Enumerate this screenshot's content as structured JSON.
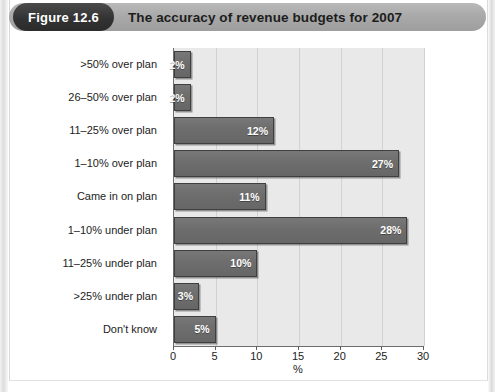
{
  "figure": {
    "badge_label": "Figure 12.6",
    "title": "The accuracy of revenue budgets for 2007"
  },
  "chart_data": {
    "type": "bar",
    "orientation": "horizontal",
    "title": "The accuracy of revenue budgets for 2007",
    "xlabel": "%",
    "ylabel": "",
    "xlim": [
      0,
      30
    ],
    "xticks": [
      0,
      5,
      10,
      15,
      20,
      25,
      30
    ],
    "xtick_labels": [
      "0",
      "5",
      "10",
      "15",
      "20",
      "25",
      "30"
    ],
    "grid": true,
    "legend": false,
    "categories": [
      ">50% over plan",
      "26–50% over plan",
      "11–25% over plan",
      "1–10% over plan",
      "Came in on plan",
      "1–10% under plan",
      "11–25% under plan",
      ">25% under plan",
      "Don't know"
    ],
    "values": [
      2,
      2,
      12,
      27,
      11,
      28,
      10,
      3,
      5
    ],
    "value_labels": [
      "2%",
      "2%",
      "12%",
      "27%",
      "11%",
      "28%",
      "10%",
      "3%",
      "5%"
    ],
    "colors": {
      "bar_fill": "#6e6e6e",
      "bar_edge": "#3f3f3f",
      "plot_background": "#e9e9e9",
      "gridline": "#d2d2d2",
      "axis": "#6d6d6d",
      "value_label_text": "#ffffff",
      "banner": "#a8a8a8",
      "badge": "#333333"
    }
  }
}
